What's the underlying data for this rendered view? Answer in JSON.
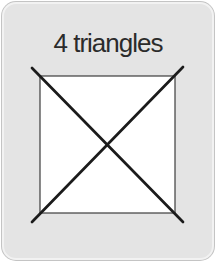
{
  "page": {
    "background": "#ffffff"
  },
  "card": {
    "title": "4 triangles",
    "background": "#e4e4e4",
    "border_color": "#c4c4c4",
    "highlight_color": "#f2f2f2",
    "title_color": "#2b2b2b"
  },
  "figure": {
    "name": "square-with-both-diagonals",
    "square_fill": "#ffffff",
    "square_stroke": "#3d3d3d",
    "diagonal_color": "#1b1b1b"
  }
}
